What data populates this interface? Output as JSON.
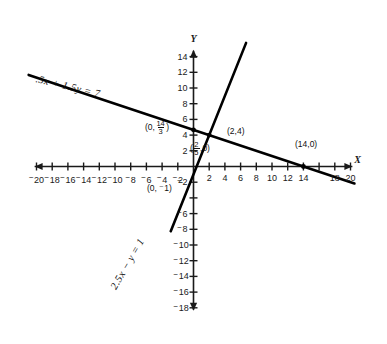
{
  "figure": {
    "type": "line-graph",
    "background_color": "#ffffff",
    "line_color": "#000000",
    "axis_color": "#1a1a1a"
  },
  "axes": {
    "x_axis_name": "X",
    "y_axis_name": "Y",
    "x_min": -21,
    "x_max": 21,
    "y_min": -19,
    "y_max": 15.5,
    "x_tick_step": 2,
    "y_tick_step": 2,
    "grid": false
  },
  "x_tick_labels": [
    {
      "value": -20,
      "text": "20",
      "negative": true
    },
    {
      "value": -18,
      "text": "18",
      "negative": true
    },
    {
      "value": -16,
      "text": "16",
      "negative": true
    },
    {
      "value": -14,
      "text": "14",
      "negative": true
    },
    {
      "value": -12,
      "text": "12",
      "negative": true
    },
    {
      "value": -10,
      "text": "10",
      "negative": true
    },
    {
      "value": -8,
      "text": "8",
      "negative": true
    },
    {
      "value": -6,
      "text": "6",
      "negative": true
    },
    {
      "value": -4,
      "text": "4",
      "negative": true
    },
    {
      "value": -2,
      "text": "2",
      "negative": true
    },
    {
      "value": 2,
      "text": "2",
      "negative": false
    },
    {
      "value": 4,
      "text": "4",
      "negative": false
    },
    {
      "value": 6,
      "text": "6",
      "negative": false
    },
    {
      "value": 8,
      "text": "8",
      "negative": false
    },
    {
      "value": 10,
      "text": "10",
      "negative": false
    },
    {
      "value": 12,
      "text": "12",
      "negative": false
    },
    {
      "value": 14,
      "text": "14",
      "negative": false
    },
    {
      "value": 18,
      "text": "18",
      "negative": false
    },
    {
      "value": 20,
      "text": "20",
      "negative": false
    }
  ],
  "y_tick_labels": [
    {
      "value": 14,
      "text": "14",
      "negative": false
    },
    {
      "value": 12,
      "text": "12",
      "negative": false
    },
    {
      "value": 10,
      "text": "10",
      "negative": false
    },
    {
      "value": 8,
      "text": "8",
      "negative": false
    },
    {
      "value": 6,
      "text": "6",
      "negative": false
    },
    {
      "value": 4,
      "text": "4",
      "negative": false
    },
    {
      "value": 2,
      "text": "2",
      "negative": false
    },
    {
      "value": -2,
      "text": "2",
      "negative": true
    },
    {
      "value": -6,
      "text": "6",
      "negative": true
    },
    {
      "value": -8,
      "text": "8",
      "negative": true
    },
    {
      "value": -10,
      "text": "10",
      "negative": true
    },
    {
      "value": -12,
      "text": "12",
      "negative": true
    },
    {
      "value": -14,
      "text": "14",
      "negative": true
    },
    {
      "value": -16,
      "text": "16",
      "negative": true
    },
    {
      "value": -18,
      "text": "18",
      "negative": true
    }
  ],
  "equations": [
    {
      "id": "line-1",
      "label": ".5x + 1.5y = 7",
      "slope": -0.3333333,
      "intercept": 4.6666667,
      "x_start": -21,
      "x_end": 20.5,
      "label_angle_deg": 13.5,
      "label_x_px": 36,
      "label_y_px": 73
    },
    {
      "id": "line-2",
      "label": "2.5x − y = 1",
      "slope": 2.5,
      "intercept": -1,
      "x_start": -2.9,
      "x_end": 6.7,
      "label_angle_deg": -60,
      "label_x_px": 113,
      "label_y_px": 283
    }
  ],
  "points": [
    {
      "id": "y-intercept-line1",
      "label_text_prefix": "(0,",
      "label_frac_num": "14",
      "label_frac_den": "3",
      "label_text_suffix": ")",
      "x": 0,
      "y": 4.6667,
      "label_x_px": 145,
      "label_y_px": 120,
      "dot": true
    },
    {
      "id": "intersection",
      "label": "(2,4)",
      "x": 2,
      "y": 4,
      "label_x_px": 227,
      "label_y_px": 127,
      "dot": true
    },
    {
      "id": "x-intercept-line2",
      "label_text_prefix": "(",
      "label_frac_num": "2",
      "label_frac_den": "5",
      "label_text_suffix": ",0)",
      "x": 0.4,
      "y": 0,
      "label_x_px": 190,
      "label_y_px": 141,
      "dot": false
    },
    {
      "id": "y-intercept-line2",
      "label_text": "(0, ⁻1)",
      "x": 0,
      "y": -1,
      "label_x_px": 147,
      "label_y_px": 184,
      "dot": false
    },
    {
      "id": "x-intercept-line1",
      "label": "(14,0)",
      "x": 14,
      "y": 0,
      "label_x_px": 295,
      "label_y_px": 140,
      "dot": true
    }
  ]
}
